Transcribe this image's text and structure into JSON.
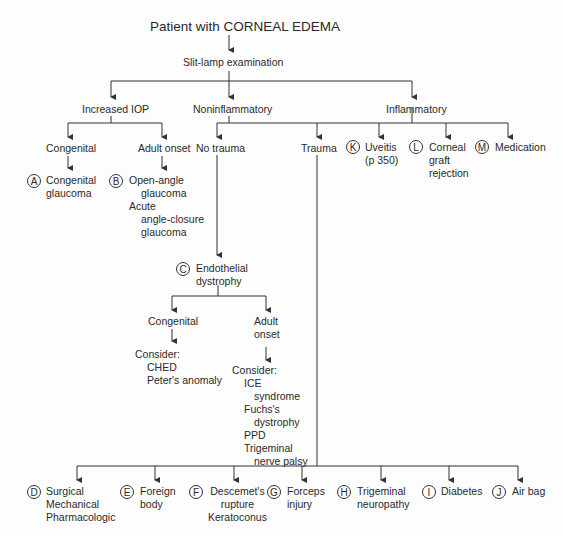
{
  "diagram": {
    "title": "Patient with CORNEAL EDEMA",
    "step1": "Slit-lamp examination",
    "branches": {
      "iop": "Increased IOP",
      "noninf": "Noninflammatory",
      "inf": "Inflammatory"
    },
    "iop": {
      "congenital": "Congenital",
      "adult": "Adult onset",
      "A": {
        "letter": "A",
        "lines": [
          "Congenital",
          "glaucoma"
        ]
      },
      "B": {
        "letter": "B",
        "lines": [
          "Open-angle",
          "glaucoma",
          "Acute",
          "angle-closure",
          "glaucoma"
        ]
      }
    },
    "notrauma": "No trauma",
    "trauma": "Trauma",
    "K": {
      "letter": "K",
      "lines": [
        "Uveitis",
        "(p 350)"
      ]
    },
    "L": {
      "letter": "L",
      "lines": [
        "Corneal",
        "graft",
        "rejection"
      ]
    },
    "M": {
      "letter": "M",
      "lines": [
        "Medication"
      ]
    },
    "C": {
      "letter": "C",
      "lines": [
        "Endothelial",
        "dystrophy"
      ]
    },
    "endo": {
      "congenital": "Congenital",
      "adult": [
        "Adult",
        "onset"
      ],
      "cong_consider": [
        "Consider:",
        "CHED",
        "Peter's anomaly"
      ],
      "adult_consider": [
        "Consider:",
        "ICE",
        "syndrome",
        "Fuchs's",
        "dystrophy",
        "PPD",
        "Trigeminal",
        "nerve palsy"
      ]
    },
    "bottom": [
      {
        "letter": "D",
        "lines": [
          "Surgical",
          "Mechanical",
          "Pharmacologic"
        ]
      },
      {
        "letter": "E",
        "lines": [
          "Foreign",
          "body"
        ]
      },
      {
        "letter": "F",
        "lines": [
          "Descemet's",
          "rupture",
          "Keratoconus"
        ]
      },
      {
        "letter": "G",
        "lines": [
          "Forceps",
          "injury"
        ]
      },
      {
        "letter": "H",
        "lines": [
          "Trigeminal",
          "neuropathy"
        ]
      },
      {
        "letter": "I",
        "lines": [
          "Diabetes"
        ]
      },
      {
        "letter": "J",
        "lines": [
          "Air bag"
        ]
      }
    ]
  }
}
